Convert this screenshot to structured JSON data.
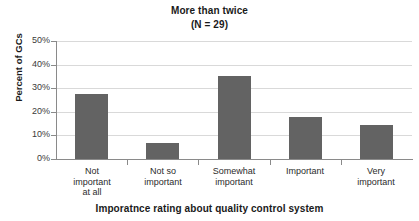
{
  "chart_data": {
    "type": "bar",
    "title": "More than twice",
    "subtitle": "(N = 29)",
    "xlabel": "Imporatnce rating about quality control system",
    "ylabel": "Percent of GCs",
    "categories": [
      "Not\nimportant\nat all",
      "Not so\nimportant",
      "Somewhat\nimportant",
      "Important",
      "Very\nimportant"
    ],
    "category_lines": [
      [
        "Not",
        "important",
        "at all"
      ],
      [
        "Not so",
        "important"
      ],
      [
        "Somewhat",
        "important"
      ],
      [
        "Important"
      ],
      [
        "Very",
        "important"
      ]
    ],
    "values": [
      27.5,
      7.0,
      35.0,
      18.0,
      14.5
    ],
    "ylim": [
      0,
      50
    ],
    "ytick_labels": [
      "50%",
      "40%",
      "30%",
      "20%",
      "10%",
      "0%"
    ],
    "ytick_values": [
      50,
      40,
      30,
      20,
      10,
      0
    ],
    "grid": true,
    "legend": "none",
    "bar_color": "#636363",
    "grid_color": "#d9d9d9",
    "axis_color": "#8a8a8a"
  }
}
